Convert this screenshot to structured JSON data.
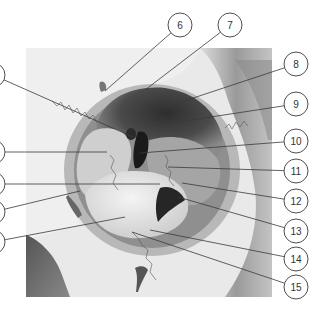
{
  "figure": {
    "palette": {
      "background": "#ffffff",
      "line": "#3a3a3a",
      "circle_stroke": "#3a3a3a",
      "bone_light": "#eeeeee",
      "bone_mid": "#c8c8c8",
      "shadow": "#6e6e6e",
      "cavity_dark": "#3c3c3c",
      "fissure_black": "#1a1a1a",
      "suture": "#555555"
    }
  },
  "callouts": [
    {
      "number": "1",
      "label": "1",
      "cx": -7,
      "cy": 75,
      "tx": 133,
      "ty": 137
    },
    {
      "number": "2",
      "label": "2",
      "cx": -7,
      "cy": 152,
      "tx": 107,
      "ty": 152
    },
    {
      "number": "3",
      "label": "3",
      "cx": -7,
      "cy": 184,
      "tx": 160,
      "ty": 184
    },
    {
      "number": "4",
      "label": "4",
      "cx": -7,
      "cy": 212,
      "tx": 80,
      "ty": 191
    },
    {
      "number": "5",
      "label": "5",
      "cx": -7,
      "cy": 242,
      "tx": 125,
      "ty": 217
    },
    {
      "number": "6",
      "label": "6",
      "cx": 180,
      "cy": 25,
      "tx": 105,
      "ty": 91
    },
    {
      "number": "7",
      "label": "7",
      "cx": 230,
      "cy": 25,
      "tx": 145,
      "ty": 90
    },
    {
      "number": "8",
      "label": "8",
      "cx": 296,
      "cy": 64,
      "tx": 163,
      "ty": 108
    },
    {
      "number": "9",
      "label": "9",
      "cx": 296,
      "cy": 104,
      "tx": 145,
      "ty": 127
    },
    {
      "number": "10",
      "label": "10",
      "cx": 296,
      "cy": 141,
      "tx": 140,
      "ty": 153
    },
    {
      "number": "11",
      "label": "11",
      "cx": 296,
      "cy": 171,
      "tx": 168,
      "ty": 167
    },
    {
      "number": "12",
      "label": "12",
      "cx": 296,
      "cy": 201,
      "tx": 182,
      "ty": 183
    },
    {
      "number": "13",
      "label": "13",
      "cx": 296,
      "cy": 231,
      "tx": 178,
      "ty": 197
    },
    {
      "number": "14",
      "label": "14",
      "cx": 296,
      "cy": 259,
      "tx": 150,
      "ty": 230
    },
    {
      "number": "15",
      "label": "15",
      "cx": 296,
      "cy": 287,
      "tx": 132,
      "ty": 232
    }
  ]
}
